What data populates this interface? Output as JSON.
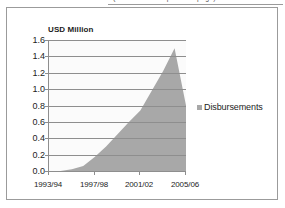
{
  "top_fragment": {
    "text": "(continued from previous page)"
  },
  "chart_data": {
    "type": "area",
    "title": "",
    "ylabel": "USD Million",
    "xlabel": "",
    "ylim": [
      0.0,
      1.6
    ],
    "ytick_labels": [
      "1.6",
      "1.4",
      "1.2",
      "1.0",
      "0.8",
      "0.6",
      "0.4",
      "0.2",
      "0.0"
    ],
    "ytick_values": [
      1.6,
      1.4,
      1.2,
      1.0,
      0.8,
      0.6,
      0.4,
      0.2,
      0.0
    ],
    "xtick_labels": [
      "1993/94",
      "1997/98",
      "2001/02",
      "2005/06"
    ],
    "grid": true,
    "legend_position": "right",
    "series": [
      {
        "name": "Disbursements",
        "color": "#a8a8a8",
        "categories": [
          "1993/94",
          "1994/95",
          "1995/96",
          "1996/97",
          "1997/98",
          "1998/99",
          "1999/00",
          "2000/01",
          "2001/02",
          "2002/03",
          "2003/04",
          "2004/05",
          "2005/06"
        ],
        "values": [
          0.0,
          0.0,
          0.02,
          0.06,
          0.17,
          0.3,
          0.45,
          0.6,
          0.74,
          0.98,
          1.22,
          1.5,
          0.8
        ]
      }
    ]
  },
  "legend": {
    "entries": [
      {
        "label": "Disbursements",
        "color": "#a8a8a8"
      }
    ]
  }
}
